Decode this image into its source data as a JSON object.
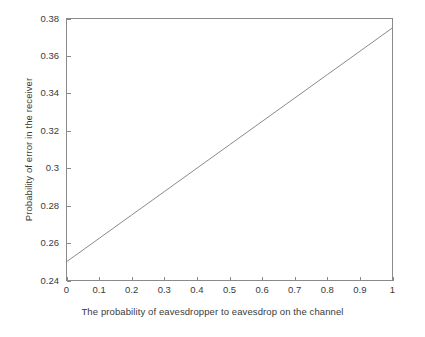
{
  "chart_data": {
    "type": "line",
    "title": "",
    "xlabel": "The probability of eavesdropper to eavesdrop on the channel",
    "ylabel": "Probability of error in the receiver",
    "xlim": [
      0,
      1
    ],
    "ylim": [
      0.24,
      0.38
    ],
    "grid": false,
    "legend": null,
    "xticks": [
      0,
      0.1,
      0.2,
      0.3,
      0.4,
      0.5,
      0.6,
      0.7,
      0.8,
      0.9,
      1
    ],
    "xtick_labels": [
      "0",
      "0.1",
      "0.2",
      "0.3",
      "0.4",
      "0.5",
      "0.6",
      "0.7",
      "0.8",
      "0.9",
      "1"
    ],
    "yticks": [
      0.24,
      0.26,
      0.28,
      0.3,
      0.32,
      0.34,
      0.36,
      0.38
    ],
    "ytick_labels": [
      "0.24",
      "0.26",
      "0.28",
      "0.3",
      "0.32",
      "0.34",
      "0.36",
      "0.38"
    ],
    "series": [
      {
        "name": "probability of error",
        "color": "#8a8a8a",
        "width": 1,
        "x": [
          0,
          0.1,
          0.2,
          0.3,
          0.4,
          0.5,
          0.6,
          0.7,
          0.8,
          0.9,
          1
        ],
        "values": [
          0.25,
          0.2625,
          0.275,
          0.2875,
          0.3,
          0.3125,
          0.325,
          0.3375,
          0.35,
          0.3625,
          0.375
        ]
      }
    ]
  },
  "axes": {
    "frame_color": "#8a8a8a",
    "text_color": "#3a3a3a",
    "background": "#ffffff"
  }
}
